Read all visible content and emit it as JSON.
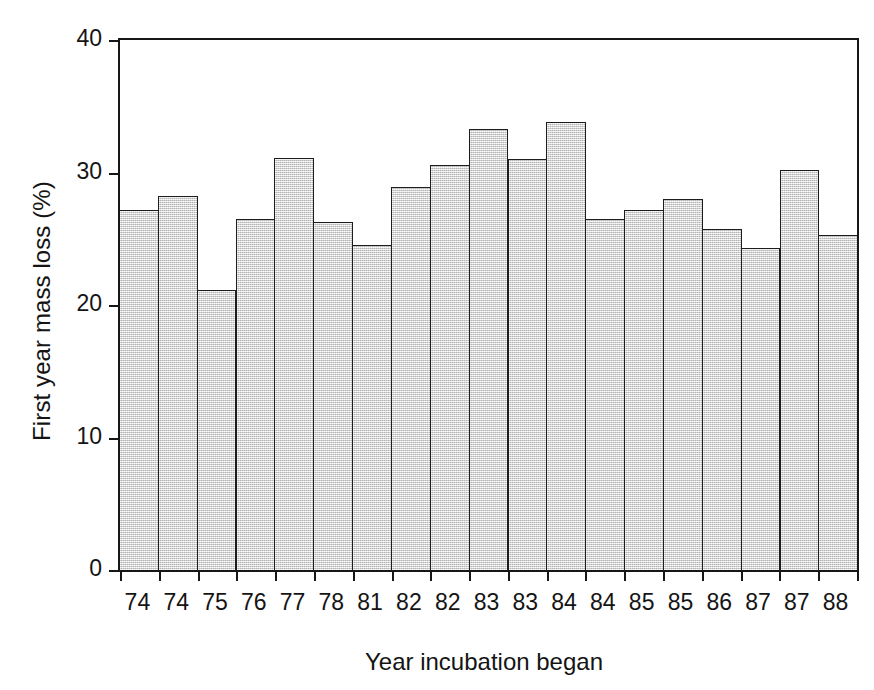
{
  "chart_data": {
    "type": "bar",
    "title": "",
    "xlabel": "Year incubation began",
    "ylabel": "First year mass loss (%)",
    "categories": [
      "74",
      "74",
      "75",
      "76",
      "77",
      "78",
      "81",
      "82",
      "82",
      "83",
      "83",
      "84",
      "84",
      "85",
      "85",
      "86",
      "87",
      "87",
      "88"
    ],
    "values": [
      27.2,
      28.2,
      21.1,
      26.5,
      31.1,
      26.3,
      24.5,
      28.9,
      30.6,
      33.3,
      31.0,
      33.8,
      26.5,
      27.2,
      28.0,
      25.7,
      24.3,
      30.2,
      25.3
    ],
    "ylim": [
      0,
      40
    ],
    "yticks": [
      0,
      10,
      20,
      30,
      40
    ],
    "ytick_labels": [
      "0",
      "10",
      "20",
      "30",
      "40"
    ],
    "grid": false,
    "legend": null,
    "series": [
      {
        "name": "First year mass loss",
        "values": [
          27.2,
          28.2,
          21.1,
          26.5,
          31.1,
          26.3,
          24.5,
          28.9,
          30.6,
          33.3,
          31.0,
          33.8,
          26.5,
          27.2,
          28.0,
          25.7,
          24.3,
          30.2,
          25.3
        ]
      }
    ],
    "bar_fill_color": "#d9d9d9",
    "bar_edge_color": "#1d1d1d",
    "axis_color": "#161616",
    "background_color": "#ffffff"
  }
}
